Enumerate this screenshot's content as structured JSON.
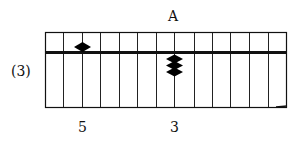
{
  "diagram": {
    "type": "soroban-abacus",
    "column_marker": "A",
    "problem_label": "(3)",
    "rod_count": 13,
    "rod_labels": [
      {
        "rod_index": 2,
        "text": "5"
      },
      {
        "rod_index": 7,
        "text": "3"
      }
    ],
    "beads": [
      {
        "rod_index": 2,
        "position": "upper",
        "count": 1,
        "value": 5
      },
      {
        "rod_index": 7,
        "position": "lower",
        "count": 3,
        "value": 3
      }
    ],
    "colors": {
      "frame": "#111111",
      "bead": "#000000",
      "background": "#ffffff"
    }
  }
}
